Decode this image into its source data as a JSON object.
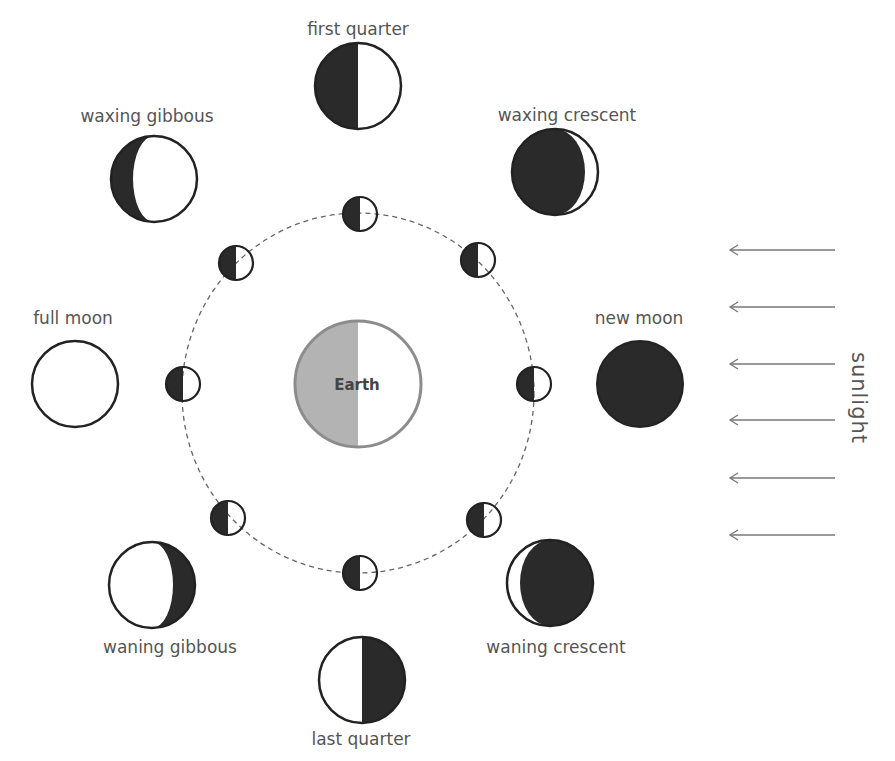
{
  "earth": {
    "label": "Earth",
    "cx": 358,
    "cy": 384,
    "r": 63,
    "dark_color": "#b3b3b3",
    "outline_color": "#8c8c8c"
  },
  "orbit": {
    "cx": 358,
    "cy": 393,
    "rx": 176,
    "ry": 180,
    "style": "dashed"
  },
  "sunlight": {
    "label": "sunlight",
    "direction": "right-to-left",
    "arrow_count": 6
  },
  "colors": {
    "dark": "#2a2a2a",
    "light": "#ffffff",
    "outline": "#222222",
    "text": "#555555",
    "arrow": "#777777"
  },
  "phases": [
    {
      "id": "new-moon",
      "label": "new moon"
    },
    {
      "id": "waxing-crescent",
      "label": "waxing crescent"
    },
    {
      "id": "first-quarter",
      "label": "first quarter"
    },
    {
      "id": "waxing-gibbous",
      "label": "waxing gibbous"
    },
    {
      "id": "full-moon",
      "label": "full moon"
    },
    {
      "id": "waning-gibbous",
      "label": "waning gibbous"
    },
    {
      "id": "last-quarter",
      "label": "last quarter"
    },
    {
      "id": "waning-crescent",
      "label": "waning crescent"
    }
  ]
}
